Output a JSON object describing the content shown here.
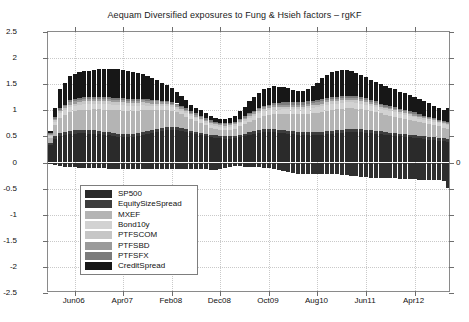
{
  "chart_data": {
    "type": "bar",
    "stacked": true,
    "title": "Aequam Diversified exposures to Fung & Hsieh factors – rgKF",
    "xlabel": "",
    "ylabel": "",
    "ylim": [
      -2.5,
      2.5
    ],
    "ytick_labels": [
      "2.5",
      "2",
      "1.5",
      "1",
      "0.5",
      "0",
      "-0.5",
      "-1",
      "-1.5",
      "-2",
      "-2.5"
    ],
    "ytick_values": [
      2.5,
      2,
      1.5,
      1,
      0.5,
      0,
      -0.5,
      -1,
      -1.5,
      -2,
      -2.5
    ],
    "right_axis_label": "0",
    "grid": true,
    "legend_position": "lower-left-inside",
    "xtick_labels": [
      "Jun06",
      "Apr07",
      "Feb08",
      "Dec08",
      "Oct09",
      "Aug10",
      "Jun11",
      "Apr12"
    ],
    "xtick_index": [
      5,
      15,
      25,
      35,
      45,
      55,
      65,
      75
    ],
    "categories": [
      "Jan06",
      "Feb06",
      "Mar06",
      "Apr06",
      "May06",
      "Jun06",
      "Jul06",
      "Aug06",
      "Sep06",
      "Oct06",
      "Nov06",
      "Dec06",
      "Jan07",
      "Feb07",
      "Mar07",
      "Apr07",
      "May07",
      "Jun07",
      "Jul07",
      "Aug07",
      "Sep07",
      "Oct07",
      "Nov07",
      "Dec07",
      "Jan08",
      "Feb08",
      "Mar08",
      "Apr08",
      "May08",
      "Jun08",
      "Jul08",
      "Aug08",
      "Sep08",
      "Oct08",
      "Nov08",
      "Dec08",
      "Jan09",
      "Feb09",
      "Mar09",
      "Apr09",
      "May09",
      "Jun09",
      "Jul09",
      "Aug09",
      "Sep09",
      "Oct09",
      "Nov09",
      "Dec09",
      "Jan10",
      "Feb10",
      "Mar10",
      "Apr10",
      "May10",
      "Jun10",
      "Jul10",
      "Aug10",
      "Sep10",
      "Oct10",
      "Nov10",
      "Dec10",
      "Jan11",
      "Feb11",
      "Mar11",
      "Apr11",
      "May11",
      "Jun11",
      "Jul11",
      "Aug11",
      "Sep11",
      "Oct11",
      "Nov11",
      "Dec11",
      "Jan12",
      "Feb12",
      "Mar12",
      "Apr12",
      "May12",
      "Jun12",
      "Jul12",
      "Aug12",
      "Sep12",
      "Oct12",
      "Nov12"
    ],
    "series": [
      {
        "name": "SP500",
        "color": "#2a2a2a",
        "values": [
          0.33,
          0.45,
          0.5,
          0.52,
          0.54,
          0.55,
          0.56,
          0.56,
          0.55,
          0.55,
          0.54,
          0.53,
          0.52,
          0.5,
          0.49,
          0.48,
          0.48,
          0.49,
          0.5,
          0.52,
          0.54,
          0.56,
          0.58,
          0.6,
          0.62,
          0.62,
          0.62,
          0.6,
          0.58,
          0.56,
          0.54,
          0.52,
          0.5,
          0.48,
          0.47,
          0.46,
          0.45,
          0.45,
          0.46,
          0.48,
          0.5,
          0.52,
          0.54,
          0.56,
          0.58,
          0.58,
          0.58,
          0.57,
          0.56,
          0.55,
          0.54,
          0.53,
          0.52,
          0.52,
          0.52,
          0.52,
          0.53,
          0.54,
          0.55,
          0.56,
          0.57,
          0.58,
          0.58,
          0.58,
          0.58,
          0.57,
          0.56,
          0.55,
          0.54,
          0.53,
          0.52,
          0.51,
          0.5,
          0.49,
          0.48,
          0.47,
          0.46,
          0.45,
          0.44,
          0.43,
          0.42,
          0.41,
          0.4
        ]
      },
      {
        "name": "EquitySizeSpread",
        "color": "#3d3d3d",
        "values": [
          0.04,
          0.05,
          0.06,
          0.06,
          0.07,
          0.07,
          0.07,
          0.07,
          0.07,
          0.07,
          0.07,
          0.06,
          0.06,
          0.06,
          0.06,
          0.06,
          0.06,
          0.06,
          0.06,
          0.06,
          0.06,
          0.06,
          0.06,
          0.06,
          0.06,
          0.06,
          0.06,
          0.06,
          0.06,
          0.05,
          0.05,
          0.05,
          0.05,
          0.05,
          0.05,
          0.05,
          0.05,
          0.05,
          0.05,
          0.05,
          0.05,
          0.06,
          0.06,
          0.06,
          0.06,
          0.06,
          0.06,
          0.06,
          0.06,
          0.06,
          0.06,
          0.06,
          0.06,
          0.06,
          0.06,
          0.06,
          0.06,
          0.06,
          0.06,
          0.06,
          0.06,
          0.06,
          0.06,
          0.06,
          0.06,
          0.06,
          0.06,
          0.06,
          0.06,
          0.05,
          0.05,
          0.05,
          0.05,
          0.05,
          0.05,
          0.05,
          0.05,
          0.05,
          0.05,
          0.05,
          0.05,
          0.05,
          0.05
        ]
      },
      {
        "name": "MXEF",
        "color": "#b4b4b4",
        "values": [
          0.1,
          0.22,
          0.3,
          0.33,
          0.35,
          0.36,
          0.37,
          0.38,
          0.39,
          0.4,
          0.41,
          0.42,
          0.43,
          0.44,
          0.45,
          0.45,
          0.45,
          0.44,
          0.43,
          0.42,
          0.4,
          0.38,
          0.36,
          0.34,
          0.32,
          0.3,
          0.28,
          0.26,
          0.24,
          0.22,
          0.2,
          0.18,
          0.16,
          0.14,
          0.13,
          0.12,
          0.12,
          0.13,
          0.14,
          0.16,
          0.18,
          0.2,
          0.22,
          0.24,
          0.26,
          0.27,
          0.28,
          0.29,
          0.3,
          0.31,
          0.32,
          0.33,
          0.34,
          0.35,
          0.36,
          0.37,
          0.38,
          0.39,
          0.4,
          0.4,
          0.4,
          0.4,
          0.4,
          0.39,
          0.38,
          0.37,
          0.36,
          0.35,
          0.34,
          0.33,
          0.32,
          0.31,
          0.3,
          0.29,
          0.28,
          0.27,
          0.26,
          0.25,
          0.24,
          0.23,
          0.22,
          0.21,
          0.2
        ]
      },
      {
        "name": "Bond10y",
        "color": "#d2d2d2",
        "values": [
          0.03,
          0.06,
          0.08,
          0.09,
          0.1,
          0.1,
          0.11,
          0.11,
          0.11,
          0.11,
          0.11,
          0.11,
          0.11,
          0.11,
          0.11,
          0.11,
          0.1,
          0.1,
          0.1,
          0.1,
          0.09,
          0.09,
          0.09,
          0.08,
          0.08,
          0.08,
          0.07,
          0.07,
          0.07,
          0.06,
          0.06,
          0.06,
          0.05,
          0.05,
          0.05,
          0.05,
          0.05,
          0.05,
          0.05,
          0.06,
          0.06,
          0.07,
          0.07,
          0.08,
          0.08,
          0.09,
          0.09,
          0.09,
          0.1,
          0.1,
          0.1,
          0.1,
          0.1,
          0.11,
          0.11,
          0.11,
          0.11,
          0.11,
          0.11,
          0.11,
          0.11,
          0.11,
          0.11,
          0.11,
          0.1,
          0.1,
          0.1,
          0.1,
          0.09,
          0.09,
          0.09,
          0.09,
          0.08,
          0.08,
          0.08,
          0.08,
          0.07,
          0.07,
          0.07,
          0.07,
          0.06,
          0.06,
          0.06
        ]
      },
      {
        "name": "PTFSCOM",
        "color": "#c6c6c6",
        "values": [
          0.02,
          0.03,
          0.04,
          0.04,
          0.05,
          0.05,
          0.05,
          0.05,
          0.05,
          0.05,
          0.05,
          0.05,
          0.05,
          0.05,
          0.05,
          0.05,
          0.05,
          0.05,
          0.05,
          0.05,
          0.05,
          0.04,
          0.04,
          0.04,
          0.04,
          0.04,
          0.04,
          0.04,
          0.03,
          0.03,
          0.03,
          0.03,
          0.03,
          0.03,
          0.03,
          0.03,
          0.03,
          0.03,
          0.03,
          0.03,
          0.04,
          0.04,
          0.04,
          0.04,
          0.04,
          0.04,
          0.05,
          0.05,
          0.05,
          0.05,
          0.05,
          0.05,
          0.05,
          0.05,
          0.05,
          0.05,
          0.05,
          0.05,
          0.05,
          0.05,
          0.05,
          0.05,
          0.05,
          0.05,
          0.05,
          0.05,
          0.04,
          0.04,
          0.04,
          0.04,
          0.04,
          0.04,
          0.04,
          0.04,
          0.03,
          0.03,
          0.03,
          0.03,
          0.03,
          0.03,
          0.03,
          0.03,
          0.03
        ]
      },
      {
        "name": "PTFSBD",
        "color": "#9a9a9a",
        "values": [
          0.02,
          0.03,
          0.03,
          0.04,
          0.04,
          0.04,
          0.04,
          0.04,
          0.04,
          0.04,
          0.04,
          0.04,
          0.04,
          0.04,
          0.04,
          0.04,
          0.04,
          0.04,
          0.04,
          0.04,
          0.04,
          0.04,
          0.04,
          0.03,
          0.03,
          0.03,
          0.03,
          0.03,
          0.03,
          0.03,
          0.03,
          0.03,
          0.03,
          0.03,
          0.03,
          0.03,
          0.03,
          0.03,
          0.03,
          0.03,
          0.03,
          0.03,
          0.03,
          0.04,
          0.04,
          0.04,
          0.04,
          0.04,
          0.04,
          0.04,
          0.04,
          0.04,
          0.04,
          0.04,
          0.04,
          0.04,
          0.04,
          0.04,
          0.04,
          0.04,
          0.04,
          0.04,
          0.04,
          0.04,
          0.04,
          0.04,
          0.04,
          0.04,
          0.03,
          0.03,
          0.03,
          0.03,
          0.03,
          0.03,
          0.03,
          0.03,
          0.03,
          0.03,
          0.03,
          0.02,
          0.02,
          0.02,
          0.02
        ]
      },
      {
        "name": "PTFSFX",
        "color": "#7b7b7b",
        "values": [
          0.02,
          0.03,
          0.03,
          0.03,
          0.04,
          0.04,
          0.04,
          0.04,
          0.04,
          0.04,
          0.04,
          0.04,
          0.04,
          0.04,
          0.04,
          0.04,
          0.04,
          0.04,
          0.04,
          0.03,
          0.03,
          0.03,
          0.03,
          0.03,
          0.03,
          0.03,
          0.03,
          0.03,
          0.03,
          0.03,
          0.03,
          0.03,
          0.03,
          0.03,
          0.02,
          0.02,
          0.02,
          0.02,
          0.02,
          0.03,
          0.03,
          0.03,
          0.03,
          0.03,
          0.03,
          0.03,
          0.04,
          0.04,
          0.04,
          0.04,
          0.04,
          0.04,
          0.04,
          0.04,
          0.04,
          0.04,
          0.04,
          0.04,
          0.04,
          0.04,
          0.04,
          0.04,
          0.04,
          0.04,
          0.04,
          0.04,
          0.03,
          0.03,
          0.03,
          0.03,
          0.03,
          0.03,
          0.03,
          0.03,
          0.03,
          0.03,
          0.03,
          0.02,
          0.02,
          0.02,
          0.02,
          0.02,
          0.02
        ]
      },
      {
        "name": "CreditSpread",
        "color": "#171717",
        "values": [
          0.05,
          0.18,
          0.36,
          0.42,
          0.46,
          0.48,
          0.5,
          0.51,
          0.51,
          0.52,
          0.53,
          0.54,
          0.55,
          0.56,
          0.56,
          0.55,
          0.54,
          0.52,
          0.5,
          0.48,
          0.45,
          0.42,
          0.38,
          0.34,
          0.3,
          0.26,
          0.22,
          0.18,
          0.15,
          0.13,
          0.11,
          0.1,
          0.09,
          0.09,
          0.08,
          0.08,
          0.08,
          0.09,
          0.11,
          0.14,
          0.18,
          0.22,
          0.26,
          0.29,
          0.31,
          0.32,
          0.32,
          0.31,
          0.29,
          0.27,
          0.24,
          0.22,
          0.22,
          0.24,
          0.28,
          0.34,
          0.4,
          0.45,
          0.48,
          0.5,
          0.5,
          0.49,
          0.47,
          0.45,
          0.43,
          0.41,
          0.39,
          0.38,
          0.37,
          0.36,
          0.35,
          0.34,
          0.33,
          0.32,
          0.31,
          0.3,
          0.29,
          0.28,
          0.26,
          0.24,
          0.22,
          0.2,
          0.26
        ]
      },
      {
        "name": "NegativeExposure",
        "color": "#2f2f2f",
        "negative": true,
        "values": [
          -0.02,
          -0.05,
          -0.07,
          -0.08,
          -0.09,
          -0.09,
          -0.1,
          -0.1,
          -0.1,
          -0.11,
          -0.11,
          -0.11,
          -0.12,
          -0.12,
          -0.12,
          -0.12,
          -0.12,
          -0.12,
          -0.12,
          -0.12,
          -0.12,
          -0.12,
          -0.12,
          -0.12,
          -0.12,
          -0.12,
          -0.12,
          -0.12,
          -0.12,
          -0.12,
          -0.13,
          -0.13,
          -0.13,
          -0.14,
          -0.14,
          -0.12,
          -0.1,
          -0.08,
          -0.07,
          -0.07,
          -0.08,
          -0.08,
          -0.09,
          -0.09,
          -0.1,
          -0.1,
          -0.12,
          -0.14,
          -0.17,
          -0.19,
          -0.21,
          -0.22,
          -0.22,
          -0.22,
          -0.22,
          -0.22,
          -0.22,
          -0.22,
          -0.22,
          -0.22,
          -0.23,
          -0.24,
          -0.25,
          -0.26,
          -0.27,
          -0.28,
          -0.29,
          -0.29,
          -0.3,
          -0.3,
          -0.3,
          -0.3,
          -0.31,
          -0.31,
          -0.32,
          -0.32,
          -0.33,
          -0.33,
          -0.33,
          -0.34,
          -0.34,
          -0.35,
          -0.48
        ]
      }
    ]
  },
  "legend": {
    "items": [
      {
        "label": "SP500",
        "color": "#2a2a2a"
      },
      {
        "label": "EquitySizeSpread",
        "color": "#3d3d3d"
      },
      {
        "label": "MXEF",
        "color": "#b4b4b4"
      },
      {
        "label": "Bond10y",
        "color": "#d2d2d2"
      },
      {
        "label": "PTFSCOM",
        "color": "#c6c6c6"
      },
      {
        "label": "PTFSBD",
        "color": "#9a9a9a"
      },
      {
        "label": "PTFSFX",
        "color": "#7b7b7b"
      },
      {
        "label": "CreditSpread",
        "color": "#171717"
      }
    ]
  }
}
